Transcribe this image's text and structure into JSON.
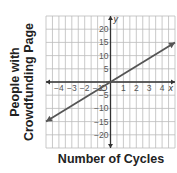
{
  "chart_data": {
    "type": "line",
    "title": "",
    "xlabel": "Number of Cycles",
    "ylabel": "People with Crowdfunding Page",
    "ylabel_lines": [
      "People with",
      "Crowdfunding Page"
    ],
    "x_axis_name": "x",
    "y_axis_name": "y",
    "origin_label": "O",
    "xlim": [
      -5,
      5
    ],
    "ylim": [
      -25,
      25
    ],
    "x_ticks": [
      -4,
      -3,
      -2,
      -1,
      1,
      2,
      3,
      4
    ],
    "y_ticks": [
      -20,
      -15,
      -10,
      -5,
      5,
      10,
      15,
      20
    ],
    "grid": true,
    "series": [
      {
        "name": "line",
        "x": [
          -5,
          0,
          5
        ],
        "y": [
          -15,
          0,
          15
        ],
        "arrows_both_ends": true
      }
    ],
    "equation": "y = 3x"
  }
}
